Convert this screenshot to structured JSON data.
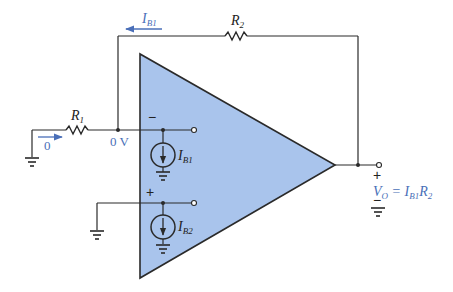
{
  "diagram": {
    "type": "op-amp bias current circuit",
    "colors": {
      "opamp_fill": "#a9c4ec",
      "annotation": "#4a6fb8",
      "wire": "#2a2a2a"
    },
    "components": {
      "r1": {
        "label": "R",
        "sub": "1"
      },
      "r2": {
        "label": "R",
        "sub": "2"
      },
      "ib1_source": {
        "label": "I",
        "sub": "B1"
      },
      "ib2_source": {
        "label": "I",
        "sub": "B2"
      }
    },
    "annotations": {
      "feedback_current": {
        "label": "I",
        "sub": "B1"
      },
      "input_current": "0",
      "node_voltage": "0 V",
      "inverting_sign": "−",
      "noninverting_sign": "+",
      "output_plus": "+",
      "output_minus": "−",
      "output_eq_v": "V",
      "output_eq_v_sub": "O",
      "output_eq_eq": " = I",
      "output_eq_i_sub": "B1",
      "output_eq_r": "R",
      "output_eq_r_sub": "2"
    }
  }
}
